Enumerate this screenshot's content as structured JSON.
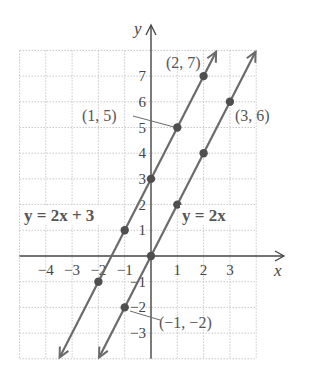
{
  "chart_data": {
    "type": "line",
    "title": "",
    "xlabel": "x",
    "ylabel": "y",
    "xlim": [
      -5,
      4
    ],
    "ylim": [
      -4,
      8
    ],
    "grid": true,
    "x_ticks": [
      -4,
      -3,
      -2,
      -1,
      1,
      2,
      3
    ],
    "y_ticks": [
      -3,
      -2,
      -1,
      1,
      2,
      3,
      4,
      5,
      6,
      7
    ],
    "x_tick_labels": [
      "−4",
      "−3",
      "−2",
      "−1",
      "1",
      "2",
      "3"
    ],
    "y_tick_labels": [
      "−3",
      "−2",
      "−1",
      "1",
      "2",
      "3",
      "4",
      "5",
      "6",
      "7"
    ],
    "series": [
      {
        "name": "y = 2x + 3",
        "slope": 2,
        "intercept": 3,
        "points": [
          [
            -2,
            -1
          ],
          [
            -1,
            1
          ],
          [
            0,
            3
          ],
          [
            1,
            5
          ],
          [
            2,
            7
          ]
        ]
      },
      {
        "name": "y = 2x",
        "slope": 2,
        "intercept": 0,
        "points": [
          [
            -1,
            -2
          ],
          [
            0,
            0
          ],
          [
            1,
            2
          ],
          [
            2,
            4
          ],
          [
            3,
            6
          ]
        ]
      }
    ],
    "annotations": [
      {
        "text": "(2, 7)",
        "point": [
          2,
          7
        ]
      },
      {
        "text": "(1, 5)",
        "point": [
          1,
          5
        ]
      },
      {
        "text": "(3, 6)",
        "point": [
          3,
          6
        ]
      },
      {
        "text": "(−1, −2)",
        "point": [
          -1,
          -2
        ]
      }
    ],
    "equation_labels": [
      "y = 2x + 3",
      "y = 2x"
    ]
  },
  "colors": {
    "line": "#6b6b6b",
    "point": "#4f4f4f",
    "grid": "#c8c8c8",
    "axis": "#444444",
    "text": "#555555"
  }
}
